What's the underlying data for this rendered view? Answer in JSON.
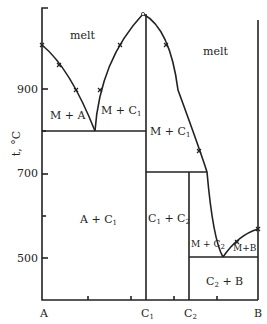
{
  "diagram": {
    "type": "phase-diagram",
    "y_axis": {
      "label": "t, °C",
      "ticks": [
        {
          "value": "900",
          "y": 89
        },
        {
          "value": "700",
          "y": 174
        },
        {
          "value": "500",
          "y": 258
        }
      ]
    },
    "x_axis": {
      "ticks": [
        "A",
        "C1",
        "C2",
        "B"
      ]
    },
    "regions": {
      "melt_left": "melt",
      "melt_right": "melt",
      "m_plus_a": "M + A",
      "m_plus_c1_left": "M + C",
      "m_plus_c1_right": "M + C",
      "a_plus_c1": "A + C",
      "c1_plus_c2": "C",
      "c1_plus_c2_b": " + C",
      "m_plus_c2": "M + C",
      "m_plus_b": "M+B",
      "c2_plus_b": "C",
      "c2_plus_b_tail": " + B"
    },
    "subscripts": {
      "one": "1",
      "two": "2"
    },
    "x_labels": {
      "a": "A",
      "c": "C",
      "b": "B"
    },
    "colors": {
      "line": "#222222",
      "background": "#ffffff"
    }
  }
}
